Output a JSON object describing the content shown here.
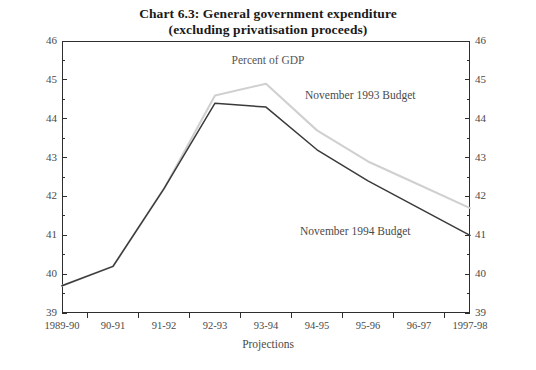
{
  "title": {
    "line1": "Chart 6.3: General government expenditure",
    "line2": "(excluding privatisation proceeds)"
  },
  "subtitle": "Percent of GDP",
  "annotations": {
    "series_1993_label": "November 1993 Budget",
    "series_1994_label": "November 1994 Budget",
    "projections_label": "Projections"
  },
  "colors": {
    "series_1993": "#d0d0d0",
    "series_1994": "#3a3a3a",
    "axis": "#2e2e2e",
    "text": "#4a4a4a",
    "background": "#ffffff"
  },
  "chart_data": {
    "type": "line",
    "title": "Chart 6.3: General government expenditure (excluding privatisation proceeds)",
    "subtitle": "Percent of GDP",
    "xlabel": "",
    "ylabel": "Percent of GDP",
    "categories": [
      "1989-90",
      "90-91",
      "91-92",
      "92-93",
      "93-94",
      "94-95",
      "95-96",
      "96-97",
      "1997-98"
    ],
    "ylim": [
      39,
      46
    ],
    "yticks_major": [
      39,
      40,
      41,
      42,
      43,
      44,
      45,
      46
    ],
    "yticks_minor": [
      39.5,
      40.5,
      41.5,
      42.5,
      43.5,
      44.5,
      45.5
    ],
    "grid": false,
    "legend": "inline-annotations",
    "series": [
      {
        "name": "November 1993 Budget",
        "color": "#d0d0d0",
        "x": [
          "1989-90",
          "90-91",
          "91-92",
          "92-93",
          "93-94",
          "94-95",
          "95-96",
          "96-97",
          "1997-98"
        ],
        "values": [
          39.7,
          40.2,
          42.2,
          44.6,
          44.9,
          43.7,
          42.9,
          42.3,
          41.7
        ]
      },
      {
        "name": "November 1994 Budget",
        "color": "#3a3a3a",
        "x": [
          "1989-90",
          "90-91",
          "91-92",
          "92-93",
          "93-94",
          "94-95",
          "95-96",
          "96-97",
          "1997-98"
        ],
        "values": [
          39.7,
          40.2,
          42.2,
          44.4,
          44.3,
          43.2,
          42.4,
          41.7,
          41.0
        ]
      }
    ]
  }
}
